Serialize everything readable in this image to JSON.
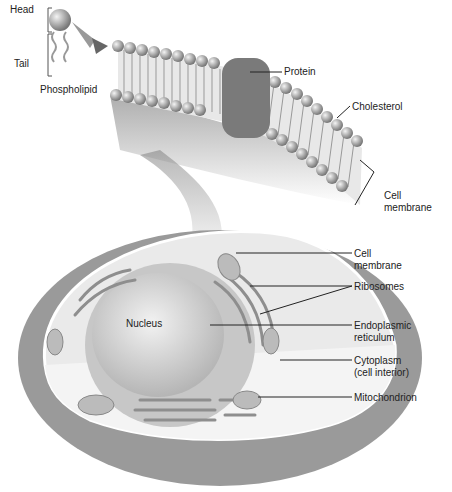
{
  "phospholipid": {
    "head": "Head",
    "tail": "Tail",
    "title": "Phospholipid"
  },
  "membrane_labels": {
    "protein": "Protein",
    "cholesterol": "Cholesterol",
    "cell_membrane": "Cell\nmembrane"
  },
  "cell_labels": {
    "nucleus": "Nucleus",
    "cell_membrane": "Cell\nmembrane",
    "ribosomes": "Ribosomes",
    "er": "Endoplasmic\nreticulum",
    "cytoplasm": "Cytoplasm\n(cell interior)",
    "mitochondrion": "Mitochondrion"
  }
}
